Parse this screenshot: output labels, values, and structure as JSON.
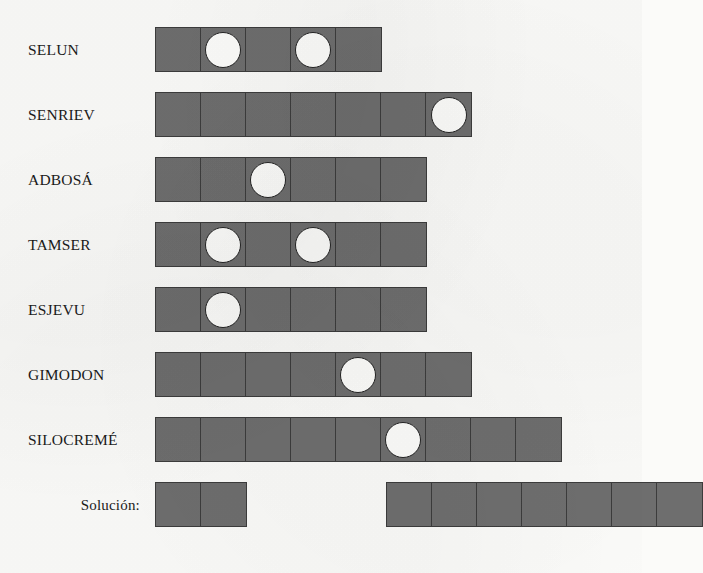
{
  "sheet": {
    "title": "Word length puzzle worksheet",
    "language": "es",
    "cell_fill_color": "#6e6e6e",
    "cell_border_color": "#3c3c3c",
    "hole_fill_color": "#fdfdfb",
    "background_color": "#fbfbf9"
  },
  "rows": [
    {
      "label": "SELUN",
      "label_align": "left",
      "groups": [
        {
          "cells": 5,
          "holes": [
            2,
            4
          ]
        }
      ]
    },
    {
      "label": "SENRIEV",
      "label_align": "left",
      "groups": [
        {
          "cells": 7,
          "holes": [
            7
          ]
        }
      ]
    },
    {
      "label": "ADBOSÁ",
      "label_align": "left",
      "groups": [
        {
          "cells": 6,
          "holes": [
            3
          ]
        }
      ]
    },
    {
      "label": "TAMSER",
      "label_align": "left",
      "groups": [
        {
          "cells": 6,
          "holes": [
            2,
            4
          ]
        }
      ]
    },
    {
      "label": "ESJEVU",
      "label_align": "left",
      "groups": [
        {
          "cells": 6,
          "holes": [
            2
          ]
        }
      ]
    },
    {
      "label": "GIMODON",
      "label_align": "left",
      "groups": [
        {
          "cells": 7,
          "holes": [
            5
          ]
        }
      ]
    },
    {
      "label": "SILOCREMÉ",
      "label_align": "left",
      "groups": [
        {
          "cells": 9,
          "holes": [
            6
          ]
        }
      ]
    },
    {
      "label": "Solución:",
      "label_align": "right",
      "groups": [
        {
          "cells": 2,
          "holes": []
        },
        {
          "cells": 7,
          "holes": [],
          "offset": 139
        }
      ]
    }
  ]
}
